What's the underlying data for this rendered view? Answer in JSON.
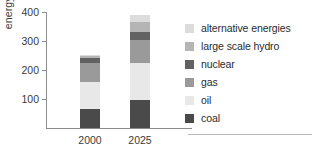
{
  "chart_data": {
    "type": "bar",
    "stacked": true,
    "title": "",
    "xlabel": "",
    "ylabel": "energy demand",
    "categories": [
      "2000",
      "2025"
    ],
    "ylim": [
      0,
      400
    ],
    "yticks": [
      100,
      200,
      300,
      400
    ],
    "ytick_labels": [
      "100",
      "200",
      "300",
      "400"
    ],
    "grid": false,
    "legend_position": "right",
    "series": [
      {
        "name": "coal",
        "color": "#4a4a4a",
        "values": [
          65,
          95
        ]
      },
      {
        "name": "oil",
        "color": "#e8e8e8",
        "values": [
          95,
          130
        ]
      },
      {
        "name": "gas",
        "color": "#9a9a9a",
        "values": [
          65,
          80
        ]
      },
      {
        "name": "nuclear",
        "color": "#626262",
        "values": [
          15,
          25
        ]
      },
      {
        "name": "large scale hydro",
        "color": "#b5b5b5",
        "values": [
          8,
          35
        ]
      },
      {
        "name": "alternative energies",
        "color": "#dcdcdc",
        "values": [
          5,
          25
        ]
      }
    ],
    "totals": [
      253,
      390
    ]
  },
  "legend": {
    "items": [
      {
        "label": "alternative energies",
        "color": "#dcdcdc"
      },
      {
        "label": "large scale hydro",
        "color": "#b5b5b5"
      },
      {
        "label": "nuclear",
        "color": "#626262"
      },
      {
        "label": "gas",
        "color": "#9a9a9a"
      },
      {
        "label": "oil",
        "color": "#e8e8e8"
      },
      {
        "label": "coal",
        "color": "#4a4a4a"
      }
    ]
  },
  "colors": {
    "axis": "#8c8c8c",
    "text": "#2b2b2b",
    "rule": "#b9b9b9",
    "background": "#ffffff"
  }
}
